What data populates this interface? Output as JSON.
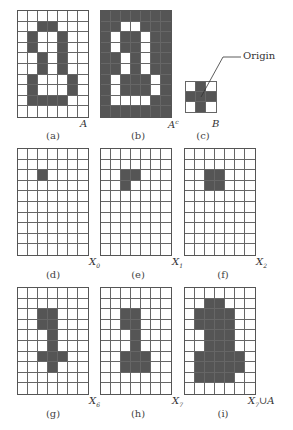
{
  "colors": {
    "filled": "#555555",
    "empty": "#ffffff",
    "gridline": "#666666"
  },
  "panels": [
    {
      "id": "a",
      "caption": "(a)",
      "label": "A",
      "sub": "",
      "rows": 10,
      "cols": 7,
      "inverted": false,
      "x": 17,
      "y": 10,
      "w": 72,
      "h": 108,
      "label_x": 80,
      "label_y": 118,
      "caption_x": 23,
      "caption_y": 130,
      "cells": [
        [
          1,
          2
        ],
        [
          1,
          3
        ],
        [
          2,
          1
        ],
        [
          2,
          4
        ],
        [
          3,
          1
        ],
        [
          3,
          4
        ],
        [
          4,
          2
        ],
        [
          4,
          4
        ],
        [
          5,
          2
        ],
        [
          5,
          4
        ],
        [
          6,
          1
        ],
        [
          6,
          5
        ],
        [
          7,
          1
        ],
        [
          7,
          5
        ],
        [
          8,
          1
        ],
        [
          8,
          2
        ],
        [
          8,
          3
        ],
        [
          8,
          4
        ]
      ]
    },
    {
      "id": "b",
      "caption": "(b)",
      "label": "A",
      "sub": "c",
      "rows": 10,
      "cols": 7,
      "inverted": true,
      "x": 100,
      "y": 10,
      "w": 72,
      "h": 108,
      "label_x": 168,
      "label_y": 118,
      "caption_x": 108,
      "caption_y": 130,
      "cells": [
        [
          1,
          2
        ],
        [
          1,
          3
        ],
        [
          2,
          1
        ],
        [
          2,
          4
        ],
        [
          3,
          1
        ],
        [
          3,
          4
        ],
        [
          4,
          2
        ],
        [
          4,
          4
        ],
        [
          5,
          2
        ],
        [
          5,
          4
        ],
        [
          6,
          1
        ],
        [
          6,
          5
        ],
        [
          7,
          1
        ],
        [
          7,
          5
        ],
        [
          8,
          1
        ],
        [
          8,
          2
        ],
        [
          8,
          3
        ],
        [
          8,
          4
        ]
      ]
    },
    {
      "id": "c",
      "caption": "(c)",
      "label": "B",
      "sub": "",
      "rows": 3,
      "cols": 3,
      "inverted": false,
      "x": 185,
      "y": 81,
      "w": 32,
      "h": 32,
      "label_x": 212,
      "label_y": 118,
      "caption_x": 173,
      "caption_y": 130,
      "cells": [
        [
          0,
          1
        ],
        [
          1,
          0
        ],
        [
          1,
          1
        ],
        [
          1,
          2
        ],
        [
          2,
          1
        ]
      ]
    },
    {
      "id": "d",
      "caption": "(d)",
      "label": "X",
      "sub": "0",
      "rows": 10,
      "cols": 7,
      "inverted": false,
      "x": 17,
      "y": 148,
      "w": 72,
      "h": 108,
      "label_x": 89,
      "label_y": 256,
      "caption_x": 23,
      "caption_y": 269,
      "cells": [
        [
          2,
          2
        ]
      ]
    },
    {
      "id": "e",
      "caption": "(e)",
      "label": "X",
      "sub": "1",
      "rows": 10,
      "cols": 7,
      "inverted": false,
      "x": 100,
      "y": 148,
      "w": 72,
      "h": 108,
      "label_x": 172,
      "label_y": 256,
      "caption_x": 108,
      "caption_y": 269,
      "cells": [
        [
          2,
          2
        ],
        [
          2,
          3
        ],
        [
          3,
          2
        ]
      ]
    },
    {
      "id": "f",
      "caption": "(f)",
      "label": "X",
      "sub": "2",
      "rows": 10,
      "cols": 7,
      "inverted": false,
      "x": 184,
      "y": 148,
      "w": 72,
      "h": 108,
      "label_x": 256,
      "label_y": 256,
      "caption_x": 193,
      "caption_y": 269,
      "cells": [
        [
          2,
          2
        ],
        [
          2,
          3
        ],
        [
          3,
          2
        ],
        [
          3,
          3
        ]
      ]
    },
    {
      "id": "g",
      "caption": "(g)",
      "label": "X",
      "sub": "6",
      "rows": 10,
      "cols": 7,
      "inverted": false,
      "x": 17,
      "y": 287,
      "w": 72,
      "h": 108,
      "label_x": 89,
      "label_y": 395,
      "caption_x": 23,
      "caption_y": 408,
      "cells": [
        [
          2,
          2
        ],
        [
          2,
          3
        ],
        [
          3,
          2
        ],
        [
          3,
          3
        ],
        [
          4,
          3
        ],
        [
          5,
          3
        ],
        [
          6,
          2
        ],
        [
          6,
          3
        ],
        [
          6,
          4
        ],
        [
          7,
          3
        ]
      ]
    },
    {
      "id": "h",
      "caption": "(h)",
      "label": "X",
      "sub": "7",
      "rows": 10,
      "cols": 7,
      "inverted": false,
      "x": 100,
      "y": 287,
      "w": 72,
      "h": 108,
      "label_x": 172,
      "label_y": 395,
      "caption_x": 108,
      "caption_y": 408,
      "cells": [
        [
          2,
          2
        ],
        [
          2,
          3
        ],
        [
          3,
          2
        ],
        [
          3,
          3
        ],
        [
          4,
          3
        ],
        [
          5,
          3
        ],
        [
          6,
          2
        ],
        [
          6,
          3
        ],
        [
          6,
          4
        ],
        [
          7,
          2
        ],
        [
          7,
          3
        ],
        [
          7,
          4
        ]
      ]
    },
    {
      "id": "i",
      "caption": "(i)",
      "label": "X",
      "sub": "7",
      "suffix": "∪A",
      "rows": 10,
      "cols": 7,
      "inverted": false,
      "x": 184,
      "y": 287,
      "w": 72,
      "h": 108,
      "label_x": 256,
      "label_y": 395,
      "caption_x": 193,
      "caption_y": 408,
      "cells": [
        [
          1,
          2
        ],
        [
          1,
          3
        ],
        [
          2,
          1
        ],
        [
          2,
          2
        ],
        [
          2,
          3
        ],
        [
          2,
          4
        ],
        [
          3,
          1
        ],
        [
          3,
          2
        ],
        [
          3,
          3
        ],
        [
          3,
          4
        ],
        [
          4,
          2
        ],
        [
          4,
          3
        ],
        [
          4,
          4
        ],
        [
          5,
          2
        ],
        [
          5,
          3
        ],
        [
          5,
          4
        ],
        [
          6,
          1
        ],
        [
          6,
          2
        ],
        [
          6,
          3
        ],
        [
          6,
          4
        ],
        [
          6,
          5
        ],
        [
          7,
          1
        ],
        [
          7,
          2
        ],
        [
          7,
          3
        ],
        [
          7,
          4
        ],
        [
          7,
          5
        ],
        [
          8,
          1
        ],
        [
          8,
          2
        ],
        [
          8,
          3
        ],
        [
          8,
          4
        ]
      ]
    }
  ],
  "origin_annotation": {
    "text": "Origin",
    "x": 243,
    "y": 50
  }
}
